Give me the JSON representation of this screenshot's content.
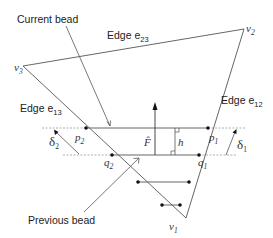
{
  "diagram": {
    "labels": {
      "current_bead": "Current bead",
      "previous_bead": "Previous bead",
      "edge_e23": "Edge e",
      "edge_e23_sub": "23",
      "edge_e13": "Edge e",
      "edge_e13_sub": "13",
      "edge_e12": "Edge e",
      "edge_e12_sub": "12"
    },
    "vertices": {
      "v1": {
        "name": "v",
        "sub": "1"
      },
      "v2": {
        "name": "v",
        "sub": "2"
      },
      "v3": {
        "name": "v",
        "sub": "3"
      }
    },
    "points": {
      "p1": {
        "name": "p",
        "sub": "1"
      },
      "p2": {
        "name": "p",
        "sub": "2"
      },
      "q1": {
        "name": "q",
        "sub": "1"
      },
      "q2": {
        "name": "q",
        "sub": "2"
      }
    },
    "quantities": {
      "delta1": {
        "name": "δ",
        "sub": "1"
      },
      "delta2": {
        "name": "δ",
        "sub": "2"
      },
      "force": "F̂",
      "height": "h"
    },
    "colors": {
      "line": "#555555",
      "dashed": "#999999",
      "dot": "#111111",
      "text": "#222222"
    }
  }
}
